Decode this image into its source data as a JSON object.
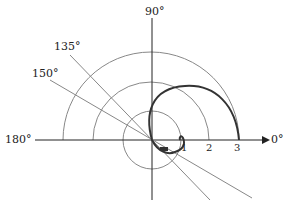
{
  "diagram": {
    "type": "polar plot",
    "angle_labels": {
      "a0": "0°",
      "a90": "90°",
      "a135": "135°",
      "a150": "150°",
      "a180": "180°"
    },
    "radial_ticks": [
      "1",
      "2",
      "3"
    ],
    "reference_circles_radii": [
      1,
      2,
      3
    ],
    "rays_degrees": [
      135,
      150
    ],
    "curve": "spiral-like loop from origin reaching r = 3 at 0°"
  }
}
